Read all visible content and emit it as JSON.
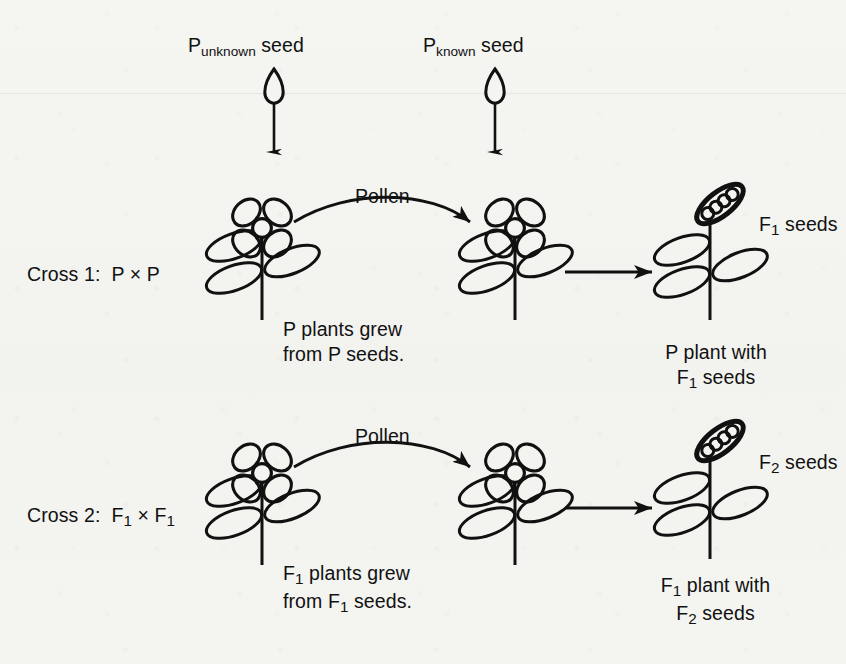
{
  "figure": {
    "background_color": "#f4f4f1",
    "ink_color": "#111111"
  },
  "seed_sources": [
    {
      "name": "p-unknown",
      "base": "P",
      "subscript": "unknown",
      "suffix": " seed",
      "icon": "seed-icon"
    },
    {
      "name": "p-known",
      "base": "P",
      "subscript": "known",
      "suffix": " seed",
      "icon": "seed-icon"
    }
  ],
  "crosses": [
    {
      "id": "cross-1",
      "label_prefix": "Cross 1:",
      "label_cross": "P × P",
      "pollen_label": "Pollen",
      "grew_caption_line1": "P plants grew",
      "grew_caption_line2": "from P seeds.",
      "seed_label_base": "F",
      "seed_label_sub": "1",
      "seed_label_suffix": " seeds",
      "product_caption_line1": "P plant with",
      "product_caption_line2_base": "F",
      "product_caption_line2_sub": "1",
      "product_caption_line2_suffix": " seeds"
    },
    {
      "id": "cross-2",
      "label_prefix": "Cross 2:",
      "label_cross_base1": "F",
      "label_cross_sub1": "1",
      "label_cross_mid": " × F",
      "label_cross_sub2": "1",
      "pollen_label": "Pollen",
      "grew_caption_line1_base": "F",
      "grew_caption_line1_sub": "1",
      "grew_caption_line1_suffix": " plants grew",
      "grew_caption_line2_base": "from F",
      "grew_caption_line2_sub": "1",
      "grew_caption_line2_suffix": " seeds.",
      "seed_label_base": "F",
      "seed_label_sub": "2",
      "seed_label_suffix": " seeds",
      "product_caption_line1_base": "F",
      "product_caption_line1_sub": "1",
      "product_caption_line1_suffix": " plant with",
      "product_caption_line2_base": "F",
      "product_caption_line2_sub": "2",
      "product_caption_line2_suffix": " seeds"
    }
  ],
  "icons": {
    "seed": "seed-icon",
    "flower": "flower-icon",
    "plant": "plant-icon",
    "seed_pod": "seed-pod-icon",
    "down_arrow": "down-arrow-icon",
    "pollen_arc_arrow": "pollen-arc-arrow-icon",
    "right_arrow": "right-arrow-icon"
  }
}
